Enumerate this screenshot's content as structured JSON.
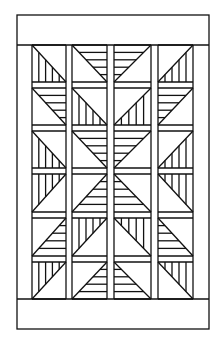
{
  "diagram": {
    "type": "quilt-pattern",
    "line_color": "#111111",
    "background": "#ffffff",
    "outer_frame": {
      "x": 17,
      "y": 15,
      "w": 192,
      "h": 314
    },
    "top_border": {
      "y1": 15,
      "y2": 45
    },
    "bottom_border": {
      "y1": 299,
      "y2": 329
    },
    "side_border_inner": {
      "left": 32,
      "right": 193
    },
    "columns": [
      {
        "x1": 32,
        "x2": 66
      },
      {
        "x1": 72,
        "x2": 107
      },
      {
        "x1": 114,
        "x2": 151
      },
      {
        "x1": 158,
        "x2": 193
      }
    ],
    "rows": [
      {
        "y1": 45,
        "y2": 82
      },
      {
        "y1": 88,
        "y2": 125
      },
      {
        "y1": 131,
        "y2": 168
      },
      {
        "y1": 174,
        "y2": 212
      },
      {
        "y1": 218,
        "y2": 256
      },
      {
        "y1": 262,
        "y2": 299
      }
    ],
    "stripes_per_triangle": 4,
    "blocks": [
      [
        {
          "diag": "tl-br",
          "fill": "lower-left",
          "stripes": "vertical"
        },
        {
          "diag": "tl-br",
          "fill": "upper-right",
          "stripes": "horizontal"
        },
        {
          "diag": "tr-bl",
          "fill": "upper-left",
          "stripes": "horizontal"
        },
        {
          "diag": "tr-bl",
          "fill": "lower-right",
          "stripes": "vertical"
        }
      ],
      [
        {
          "diag": "tl-br",
          "fill": "upper-right",
          "stripes": "horizontal"
        },
        {
          "diag": "tl-br",
          "fill": "lower-left",
          "stripes": "vertical"
        },
        {
          "diag": "tr-bl",
          "fill": "lower-right",
          "stripes": "vertical"
        },
        {
          "diag": "tr-bl",
          "fill": "upper-left",
          "stripes": "horizontal"
        }
      ],
      [
        {
          "diag": "tl-br",
          "fill": "lower-left",
          "stripes": "vertical"
        },
        {
          "diag": "tl-br",
          "fill": "upper-right",
          "stripes": "horizontal"
        },
        {
          "diag": "tr-bl",
          "fill": "upper-left",
          "stripes": "horizontal"
        },
        {
          "diag": "tr-bl",
          "fill": "lower-right",
          "stripes": "vertical"
        }
      ],
      [
        {
          "diag": "tr-bl",
          "fill": "upper-left",
          "stripes": "vertical"
        },
        {
          "diag": "tr-bl",
          "fill": "lower-right",
          "stripes": "horizontal"
        },
        {
          "diag": "tl-br",
          "fill": "lower-left",
          "stripes": "horizontal"
        },
        {
          "diag": "tl-br",
          "fill": "upper-right",
          "stripes": "vertical"
        }
      ],
      [
        {
          "diag": "tr-bl",
          "fill": "lower-right",
          "stripes": "horizontal"
        },
        {
          "diag": "tr-bl",
          "fill": "upper-left",
          "stripes": "vertical"
        },
        {
          "diag": "tl-br",
          "fill": "upper-right",
          "stripes": "vertical"
        },
        {
          "diag": "tl-br",
          "fill": "lower-left",
          "stripes": "horizontal"
        }
      ],
      [
        {
          "diag": "tr-bl",
          "fill": "upper-left",
          "stripes": "vertical"
        },
        {
          "diag": "tr-bl",
          "fill": "lower-right",
          "stripes": "horizontal"
        },
        {
          "diag": "tl-br",
          "fill": "lower-left",
          "stripes": "horizontal"
        },
        {
          "diag": "tl-br",
          "fill": "upper-right",
          "stripes": "vertical"
        }
      ]
    ]
  }
}
